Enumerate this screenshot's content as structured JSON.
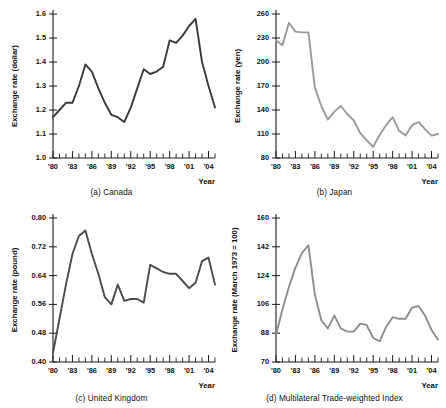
{
  "figure": {
    "panel_count": 4,
    "axis_color": "#1a1a1a",
    "background": "#ffffff"
  },
  "panels": [
    {
      "key": "canada",
      "caption": "(a) Canada",
      "ylabel": "Exchange rate (dollar)",
      "xlabel": "Year"
    },
    {
      "key": "japan",
      "caption": "(b) Japan",
      "ylabel": "Exchange rate (yen)",
      "xlabel": "Year"
    },
    {
      "key": "uk",
      "caption": "(c) United Kingdom",
      "ylabel": "Exchange rate (pound)",
      "xlabel": "Year"
    },
    {
      "key": "mtwi",
      "caption": "(d) Multilateral Trade-weighted Index",
      "ylabel": "Exchange rate (March 1973 = 100)",
      "xlabel": "Year"
    }
  ],
  "chart_data": [
    {
      "type": "line",
      "key": "canada",
      "title": "(a) Canada",
      "xlabel": "Year",
      "ylabel": "Exchange rate (dollar)",
      "line_color": "#3a3a3a",
      "grid": false,
      "legend": "none",
      "xlim": [
        1980,
        2005
      ],
      "ylim": [
        1.0,
        1.6
      ],
      "yticks": [
        1.0,
        1.1,
        1.2,
        1.3,
        1.4,
        1.5,
        1.6
      ],
      "ytick_labels": [
        "1.0",
        "1.1",
        "1.2",
        "1.3",
        "1.4",
        "1.5",
        "1.6"
      ],
      "xticks": [
        1980,
        1981,
        1982,
        1983,
        1984,
        1985,
        1986,
        1987,
        1988,
        1989,
        1990,
        1991,
        1992,
        1993,
        1994,
        1995,
        1996,
        1997,
        1998,
        1999,
        2000,
        2001,
        2002,
        2003,
        2004,
        2005
      ],
      "xtick_labels": [
        "'80",
        "'83",
        "'86",
        "'89",
        "'92",
        "'95",
        "'98",
        "'01",
        "'04"
      ],
      "xtick_label_years": [
        1980,
        1983,
        1986,
        1989,
        1992,
        1995,
        1998,
        2001,
        2004
      ],
      "x": [
        1980,
        1981,
        1982,
        1983,
        1984,
        1985,
        1986,
        1987,
        1988,
        1989,
        1990,
        1991,
        1992,
        1993,
        1994,
        1995,
        1996,
        1997,
        1998,
        1999,
        2000,
        2001,
        2002,
        2003,
        2004,
        2005
      ],
      "values": [
        1.17,
        1.2,
        1.23,
        1.23,
        1.3,
        1.39,
        1.36,
        1.29,
        1.23,
        1.18,
        1.17,
        1.15,
        1.21,
        1.29,
        1.37,
        1.35,
        1.36,
        1.38,
        1.49,
        1.48,
        1.51,
        1.55,
        1.58,
        1.4,
        1.3,
        1.21
      ]
    },
    {
      "type": "line",
      "key": "japan",
      "title": "(b) Japan",
      "xlabel": "Year",
      "ylabel": "Exchange rate (yen)",
      "line_color": "#9a9a9a",
      "grid": false,
      "legend": "none",
      "xlim": [
        1980,
        2005
      ],
      "ylim": [
        80,
        260
      ],
      "yticks": [
        80,
        110,
        140,
        170,
        200,
        230,
        260
      ],
      "ytick_labels": [
        "80",
        "110",
        "140",
        "170",
        "200",
        "230",
        "260"
      ],
      "xticks": [
        1980,
        1981,
        1982,
        1983,
        1984,
        1985,
        1986,
        1987,
        1988,
        1989,
        1990,
        1991,
        1992,
        1993,
        1994,
        1995,
        1996,
        1997,
        1998,
        1999,
        2000,
        2001,
        2002,
        2003,
        2004,
        2005
      ],
      "xtick_labels": [
        "'80",
        "'83",
        "'86",
        "'89",
        "'92",
        "'95",
        "'98",
        "'01",
        "'04"
      ],
      "xtick_label_years": [
        1980,
        1983,
        1986,
        1989,
        1992,
        1995,
        1998,
        2001,
        2004
      ],
      "x": [
        1980,
        1981,
        1982,
        1983,
        1984,
        1985,
        1986,
        1987,
        1988,
        1989,
        1990,
        1991,
        1992,
        1993,
        1994,
        1995,
        1996,
        1997,
        1998,
        1999,
        2000,
        2001,
        2002,
        2003,
        2004,
        2005
      ],
      "values": [
        227,
        221,
        249,
        238,
        237,
        237,
        168,
        145,
        128,
        138,
        145,
        135,
        127,
        111,
        102,
        94,
        109,
        121,
        131,
        114,
        108,
        121,
        125,
        116,
        108,
        110
      ]
    },
    {
      "type": "line",
      "key": "uk",
      "title": "(c) United Kingdom",
      "xlabel": "Year",
      "ylabel": "Exchange rate (pound)",
      "line_color": "#4a4a4a",
      "grid": false,
      "legend": "none",
      "xlim": [
        1980,
        2005
      ],
      "ylim": [
        0.4,
        0.8
      ],
      "yticks": [
        0.4,
        0.48,
        0.56,
        0.64,
        0.72,
        0.8
      ],
      "ytick_labels": [
        "0.40",
        "0.48",
        "0.56",
        "0.64",
        "0.72",
        "0.80"
      ],
      "xticks": [
        1980,
        1981,
        1982,
        1983,
        1984,
        1985,
        1986,
        1987,
        1988,
        1989,
        1990,
        1991,
        1992,
        1993,
        1994,
        1995,
        1996,
        1997,
        1998,
        1999,
        2000,
        2001,
        2002,
        2003,
        2004,
        2005
      ],
      "xtick_labels": [
        "'80",
        "'83",
        "'86",
        "'89",
        "'92",
        "'95",
        "'98",
        "'01",
        "'04"
      ],
      "xtick_label_years": [
        1980,
        1983,
        1986,
        1989,
        1992,
        1995,
        1998,
        2001,
        2004
      ],
      "x": [
        1980,
        1981,
        1982,
        1983,
        1984,
        1985,
        1986,
        1987,
        1988,
        1989,
        1990,
        1991,
        1992,
        1993,
        1994,
        1995,
        1996,
        1997,
        1998,
        1999,
        2000,
        2001,
        2002,
        2003,
        2004,
        2005
      ],
      "values": [
        0.425,
        0.52,
        0.615,
        0.7,
        0.75,
        0.765,
        0.7,
        0.645,
        0.58,
        0.56,
        0.615,
        0.57,
        0.575,
        0.575,
        0.565,
        0.67,
        0.66,
        0.65,
        0.645,
        0.645,
        0.625,
        0.605,
        0.62,
        0.68,
        0.69,
        0.615
      ]
    },
    {
      "type": "line",
      "key": "mtwi",
      "title": "(d) Multilateral Trade-weighted Index",
      "xlabel": "Year",
      "ylabel": "Exchange rate (March 1973 = 100)",
      "line_color": "#8e8e8e",
      "grid": false,
      "legend": "none",
      "xlim": [
        1980,
        2005
      ],
      "ylim": [
        70,
        160
      ],
      "yticks": [
        70,
        88,
        106,
        124,
        142,
        160
      ],
      "ytick_labels": [
        "70",
        "88",
        "106",
        "124",
        "142",
        "160"
      ],
      "xticks": [
        1980,
        1981,
        1982,
        1983,
        1984,
        1985,
        1986,
        1987,
        1988,
        1989,
        1990,
        1991,
        1992,
        1993,
        1994,
        1995,
        1996,
        1997,
        1998,
        1999,
        2000,
        2001,
        2002,
        2003,
        2004,
        2005
      ],
      "xtick_labels": [
        "'80",
        "'83",
        "'86",
        "'89",
        "'92",
        "'95",
        "'98",
        "'01",
        "'04"
      ],
      "xtick_label_years": [
        1980,
        1983,
        1986,
        1989,
        1992,
        1995,
        1998,
        2001,
        2004
      ],
      "x": [
        1980,
        1981,
        1982,
        1983,
        1984,
        1985,
        1986,
        1987,
        1988,
        1989,
        1990,
        1991,
        1992,
        1993,
        1994,
        1995,
        1996,
        1997,
        1998,
        1999,
        2000,
        2001,
        2002,
        2003,
        2004,
        2005
      ],
      "values": [
        87,
        103,
        117,
        129,
        138,
        143,
        112,
        96,
        91,
        99,
        91,
        89,
        89,
        94,
        93,
        85,
        83,
        92,
        98,
        97,
        97,
        104,
        105,
        99,
        90,
        84
      ]
    }
  ]
}
